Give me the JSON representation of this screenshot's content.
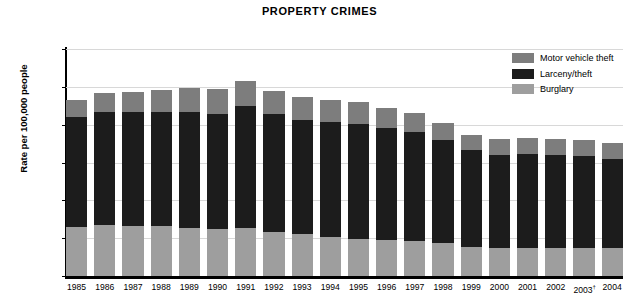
{
  "chart_data": {
    "type": "bar",
    "subtype": "stacked-bar",
    "title": "PROPERTY CRIMES",
    "xlabel": "",
    "ylabel": "Rate per 100,000 people",
    "ylim": [
      0,
      6000
    ],
    "ytick_values": [
      0,
      1000,
      2000,
      3000,
      4000,
      5000,
      6000
    ],
    "ytick_labels": [
      "0",
      "1,000",
      "2,000",
      "3,000",
      "4,000",
      "5,000",
      "6,000"
    ],
    "grid": true,
    "legend_position": "top-right",
    "categories": [
      "1985",
      "1986",
      "1987",
      "1988",
      "1989",
      "1990",
      "1991",
      "1992",
      "1993",
      "1994",
      "1995",
      "1996",
      "1997",
      "1998",
      "1999",
      "2000",
      "2001",
      "2002",
      "2003",
      "2004"
    ],
    "category_labels": [
      "1985",
      "1986",
      "1987",
      "1988",
      "1989",
      "1990",
      "1991",
      "1992",
      "1993",
      "1994",
      "1995",
      "1996",
      "1997",
      "1998",
      "1999",
      "2000",
      "2001",
      "2002",
      "2003†",
      "2004"
    ],
    "footnote_marker": "†",
    "footnote_year": "2003",
    "stack_order_bottom_to_top": [
      "Burglary",
      "Larceny/theft",
      "Motor vehicle theft"
    ],
    "series": [
      {
        "name": "Burglary",
        "color": "#9e9e9e",
        "values": [
          1290,
          1350,
          1330,
          1310,
          1280,
          1240,
          1260,
          1170,
          1100,
          1040,
          990,
          940,
          920,
          860,
          770,
          730,
          740,
          750,
          740,
          730
        ]
      },
      {
        "name": "Larceny/theft",
        "color": "#1c1c1c",
        "values": [
          2910,
          2980,
          3000,
          3030,
          3050,
          3050,
          3230,
          3100,
          3030,
          3030,
          3040,
          2980,
          2890,
          2730,
          2550,
          2480,
          2490,
          2450,
          2420,
          2360
        ]
      },
      {
        "name": "Motor vehicle theft",
        "color": "#7d7d7d",
        "values": [
          460,
          510,
          530,
          590,
          630,
          660,
          660,
          630,
          610,
          590,
          560,
          530,
          510,
          460,
          420,
          410,
          430,
          430,
          430,
          420
        ]
      }
    ],
    "totals": [
      4660,
      4840,
      4860,
      4930,
      4960,
      4950,
      5150,
      4900,
      4740,
      4660,
      4590,
      4450,
      4320,
      4050,
      3740,
      3620,
      3660,
      3630,
      3590,
      3510
    ]
  },
  "legend": {
    "items": [
      {
        "label": "Motor vehicle theft",
        "color": "#7d7d7d"
      },
      {
        "label": "Larceny/theft",
        "color": "#1c1c1c"
      },
      {
        "label": "Burglary",
        "color": "#9e9e9e"
      }
    ]
  }
}
